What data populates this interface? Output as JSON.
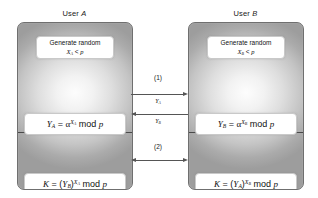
{
  "diagram": {
    "columns": [
      {
        "id": "a",
        "label_prefix": "User ",
        "label_var": "A"
      },
      {
        "id": "b",
        "label_prefix": "User ",
        "label_var": "B"
      }
    ]
  },
  "user_a": {
    "header_prefix": "User ",
    "header_var": "A",
    "generate": {
      "line1": "Generate random",
      "var": "X",
      "sub": "A",
      "rel": " < ",
      "modulus": "p"
    },
    "public_key": {
      "lhs_var": "Y",
      "lhs_sub": "A",
      "eq": " = ",
      "base": "α",
      "exp_var": "X",
      "exp_sub": "A",
      "mod": "mod",
      "modulus": "p"
    },
    "secret_key": {
      "lhs": "K",
      "eq": " = ",
      "open": "(",
      "base_var": "Y",
      "base_sub": "B",
      "close": ")",
      "exp_var": "X",
      "exp_sub": "A",
      "mod": "mod",
      "modulus": "p"
    }
  },
  "user_b": {
    "header_prefix": "User ",
    "header_var": "B",
    "generate": {
      "line1": "Generate random",
      "var": "X",
      "sub": "B",
      "rel": " < ",
      "modulus": "p"
    },
    "public_key": {
      "lhs_var": "Y",
      "lhs_sub": "B",
      "eq": " = ",
      "base": "α",
      "exp_var": "X",
      "exp_sub": "B",
      "mod": "mod",
      "modulus": "p"
    },
    "secret_key": {
      "lhs": "K",
      "eq": " = ",
      "open": "(",
      "base_var": "Y",
      "base_sub": "A",
      "close": ")",
      "exp_var": "X",
      "exp_sub": "B",
      "mod": "mod",
      "modulus": "p"
    }
  },
  "exchange": {
    "step1_label": "(1)",
    "step2_label": "(2)",
    "message_ab_var": "Y",
    "message_ab_sub": "A",
    "message_ba_var": "Y",
    "message_ba_sub": "B"
  },
  "colors": {
    "panel_border": "#6f6f6f",
    "panel_divider": "#4a4a4a",
    "arrow": "#555555",
    "text": "#1a1a1a",
    "box_fill": "#ffffff",
    "background": "#ffffff"
  }
}
